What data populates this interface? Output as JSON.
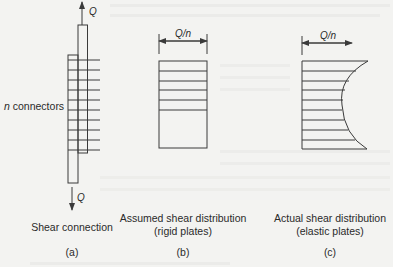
{
  "figure": {
    "panel_a": {
      "force_top": "Q",
      "force_bottom": "Q",
      "connectors_label_var": "n",
      "connectors_label_text": " connectors",
      "caption_line1": "Shear connection",
      "tag": "(a)"
    },
    "panel_b": {
      "dimension_label": "Q/n",
      "caption_line1": "Assumed shear distribution",
      "caption_line2": "(rigid plates)",
      "tag": "(b)"
    },
    "panel_c": {
      "dimension_label": "Q/n",
      "caption_line1": "Actual shear distribution",
      "caption_line2": "(elastic plates)",
      "tag": "(c)"
    }
  },
  "colors": {
    "background": "#f3f3f1",
    "ink": "#3a3a3a"
  }
}
